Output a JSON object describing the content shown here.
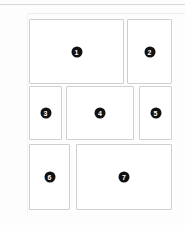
{
  "canvas": {
    "width": 185,
    "height": 225,
    "background_color": "#fdfdfd",
    "page_background_color": "#ffffff"
  },
  "rules": {
    "top_rule_color": "#d8d8d8",
    "secondary_rule_color": "#ededed",
    "gutter_edge_color": "#f2f2f2"
  },
  "style": {
    "box_fill_color": "#ffffff",
    "box_border_color": "#cfcfcf",
    "badge_fill_color": "#111111",
    "badge_text_color": "#ffffff"
  },
  "layout": {
    "name": "numbered-placeholder-grid",
    "row_count": 3,
    "box_count": 7,
    "rows": [
      {
        "name": "row-top",
        "box_labels": [
          "1",
          "2"
        ]
      },
      {
        "name": "row-middle",
        "box_labels": [
          "3",
          "4",
          "5"
        ]
      },
      {
        "name": "row-bottom",
        "box_labels": [
          "6",
          "7"
        ]
      }
    ]
  },
  "boxes": [
    {
      "id": "box-1",
      "label": "1",
      "row": 1,
      "column": 1,
      "x": 29,
      "y": 19,
      "width": 95,
      "height": 65
    },
    {
      "id": "box-2",
      "label": "2",
      "row": 1,
      "column": 2,
      "x": 127,
      "y": 19,
      "width": 45,
      "height": 65
    },
    {
      "id": "box-3",
      "label": "3",
      "row": 2,
      "column": 1,
      "x": 29,
      "y": 86,
      "width": 33,
      "height": 54
    },
    {
      "id": "box-4",
      "label": "4",
      "row": 2,
      "column": 2,
      "x": 66,
      "y": 86,
      "width": 68,
      "height": 54
    },
    {
      "id": "box-5",
      "label": "5",
      "row": 2,
      "column": 3,
      "x": 139,
      "y": 86,
      "width": 33,
      "height": 54
    },
    {
      "id": "box-6",
      "label": "6",
      "row": 3,
      "column": 1,
      "x": 29,
      "y": 144,
      "width": 41,
      "height": 66
    },
    {
      "id": "box-7",
      "label": "7",
      "row": 3,
      "column": 2,
      "x": 76,
      "y": 144,
      "width": 96,
      "height": 66
    }
  ]
}
